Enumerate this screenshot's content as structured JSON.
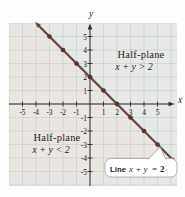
{
  "figure": {
    "x_axis_label": "x",
    "y_axis_label": "y",
    "upper_region": {
      "line1": "Half-plane",
      "line2": "x + y > 2"
    },
    "lower_region": {
      "line1": "Half-plane",
      "line2": "x + y < 2"
    },
    "callout": {
      "word": "Line",
      "math": "x + y",
      "equals": "=",
      "value": "2"
    }
  },
  "colors": {
    "upper_fill": "#e6e9e5",
    "lower_fill": "#eae6e1",
    "grid": "#c6cbc6",
    "axis": "#2b2b2b",
    "line": "#6d443d",
    "point": "#57342f",
    "text": "#1f1f1f",
    "tick_text": "#161616",
    "callout_bg": "#ffffff",
    "callout_border": "#a9a9a9"
  },
  "chart_data": {
    "type": "line",
    "equation": "x + y = 2",
    "title": "",
    "xlabel": "x",
    "ylabel": "y",
    "xlim": [
      -6.1,
      6.4
    ],
    "ylim": [
      -6.1,
      6.0
    ],
    "grid": true,
    "x_ticks": [
      -5,
      -4,
      -3,
      -2,
      -1,
      1,
      2,
      3,
      4,
      5
    ],
    "y_ticks": [
      5,
      4,
      3,
      2,
      1,
      -1,
      -2,
      -3,
      -4,
      -5
    ],
    "line_points": [
      [
        -3,
        5
      ],
      [
        -2,
        4
      ],
      [
        -1,
        3
      ],
      [
        0,
        2
      ],
      [
        1,
        1
      ],
      [
        2,
        0
      ],
      [
        3,
        -1
      ],
      [
        4,
        -2
      ],
      [
        5,
        -3
      ]
    ],
    "intercepts": {
      "x_intercept": [
        2,
        0
      ],
      "y_intercept": [
        0,
        2
      ]
    },
    "regions": [
      {
        "label": "Half-plane x + y > 2",
        "relation": "x + y > 2",
        "position": "upper-right"
      },
      {
        "label": "Half-plane x + y < 2",
        "relation": "x + y < 2",
        "position": "lower-left"
      }
    ]
  }
}
